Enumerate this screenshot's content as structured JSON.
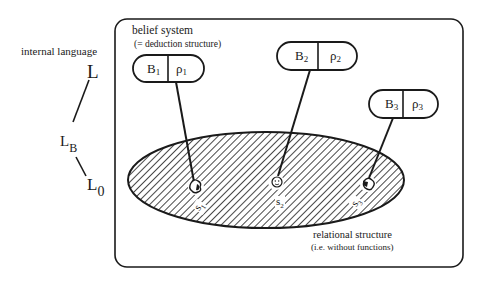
{
  "diagram": {
    "left_label": "internal language",
    "levels": [
      {
        "base": "L",
        "sub": ""
      },
      {
        "base": "L",
        "sub": "B"
      },
      {
        "base": "L",
        "sub": "0"
      }
    ],
    "belief_system": {
      "title": "belief system",
      "subtitle": "(= deduction structure)"
    },
    "beliefs": [
      {
        "b": "B",
        "b_sub": "1",
        "rho": "ρ",
        "rho_sub": "1"
      },
      {
        "b": "B",
        "b_sub": "2",
        "rho": "ρ",
        "rho_sub": "2"
      },
      {
        "b": "B",
        "b_sub": "3",
        "rho": "ρ",
        "rho_sub": "3"
      }
    ],
    "relational_structure": {
      "title": "relational structure",
      "subtitle": "(i.e. without functions)"
    },
    "states": [
      {
        "label": "s",
        "sub": "1"
      },
      {
        "label": "s",
        "sub": "2"
      },
      {
        "label": "s",
        "sub": "3"
      }
    ]
  },
  "colors": {
    "ink": "#1a1a1a",
    "background": "#ffffff"
  }
}
